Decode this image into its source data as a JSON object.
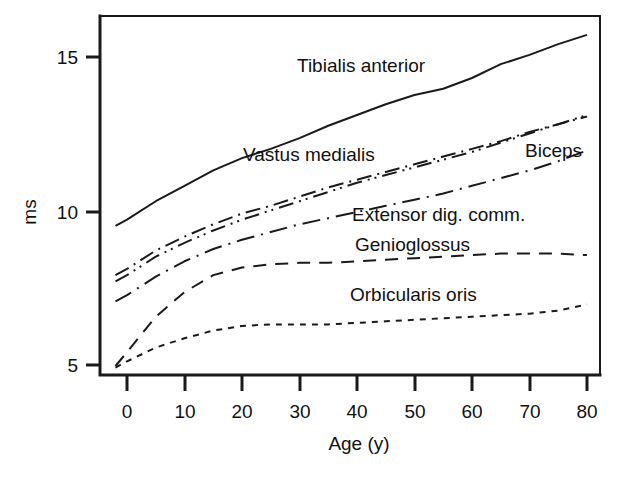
{
  "chart_data": {
    "type": "line",
    "title": "",
    "xlabel": "Age (y)",
    "ylabel": "ms",
    "xlim": [
      -2,
      80
    ],
    "ylim": [
      4.6,
      16.4
    ],
    "xticks": [
      0,
      10,
      20,
      30,
      40,
      50,
      60,
      70,
      80
    ],
    "xticklabels": [
      "0",
      "10",
      "20",
      "30",
      "40",
      "50",
      "60",
      "70",
      "80"
    ],
    "yticks": [
      5,
      10,
      15
    ],
    "yticklabels": [
      "5",
      "10",
      "15"
    ],
    "grid": false,
    "legend_position": "inline-annotations",
    "x": [
      -2,
      0,
      5,
      10,
      15,
      20,
      25,
      30,
      35,
      40,
      45,
      50,
      55,
      60,
      65,
      70,
      75,
      80
    ],
    "series": [
      {
        "name": "Tibialis anterior",
        "linestyle": "solid",
        "values": [
          9.55,
          9.75,
          10.35,
          10.85,
          11.35,
          11.75,
          12.05,
          12.4,
          12.8,
          13.15,
          13.5,
          13.8,
          14.0,
          14.35,
          14.8,
          15.1,
          15.45,
          15.75
        ],
        "label_x": 297,
        "label_y": 72
      },
      {
        "name": "Vastus medialis",
        "linestyle": "dashdot",
        "values": [
          7.95,
          8.15,
          8.75,
          9.2,
          9.6,
          9.95,
          10.2,
          10.5,
          10.8,
          11.05,
          11.3,
          11.55,
          11.8,
          12.05,
          12.3,
          12.6,
          12.85,
          13.1
        ],
        "label_x": 243,
        "label_y": 161
      },
      {
        "name": "Biceps",
        "linestyle": "dashdotdot",
        "values": [
          7.75,
          7.95,
          8.55,
          9.0,
          9.4,
          9.75,
          10.05,
          10.35,
          10.65,
          10.95,
          11.2,
          11.45,
          11.7,
          11.95,
          12.25,
          12.55,
          12.85,
          13.15
        ],
        "label_x": 525,
        "label_y": 157
      },
      {
        "name": "Extensor dig. comm.",
        "linestyle": "longdashdot",
        "values": [
          7.1,
          7.3,
          7.9,
          8.4,
          8.8,
          9.1,
          9.35,
          9.6,
          9.8,
          10.0,
          10.2,
          10.4,
          10.6,
          10.85,
          11.1,
          11.35,
          11.65,
          12.0
        ],
        "label_x": 352,
        "label_y": 221
      },
      {
        "name": "Genioglossus",
        "linestyle": "dashed",
        "values": [
          5.0,
          5.45,
          6.6,
          7.4,
          7.95,
          8.2,
          8.3,
          8.35,
          8.35,
          8.4,
          8.45,
          8.5,
          8.55,
          8.6,
          8.65,
          8.65,
          8.65,
          8.6
        ],
        "label_x": 355,
        "label_y": 251
      },
      {
        "name": "Orbicularis oris",
        "linestyle": "dotted",
        "values": [
          4.95,
          5.15,
          5.6,
          5.9,
          6.15,
          6.3,
          6.35,
          6.35,
          6.35,
          6.4,
          6.45,
          6.5,
          6.55,
          6.6,
          6.65,
          6.7,
          6.8,
          7.0
        ],
        "label_x": 350,
        "label_y": 301
      }
    ]
  },
  "axes": {
    "y_label_text": "ms",
    "x_label_text": "Age (y)"
  },
  "colors": {
    "line": "#1a1a1a",
    "text": "#111111",
    "background": "#ffffff"
  }
}
